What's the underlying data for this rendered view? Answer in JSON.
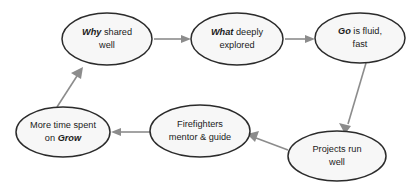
{
  "diagram": {
    "type": "cycle-flowchart",
    "colors": {
      "node_fill": "#f7f7f7",
      "node_stroke": "#2b2b2b",
      "edge": "#8c8c8c",
      "text": "#1b1b1b",
      "background": "#ffffff"
    },
    "nodes": [
      {
        "id": "why-shared-well",
        "name": "node-why-shared-well",
        "keyword": "Why",
        "line1_rest": " shared",
        "line2": "well",
        "full_text": "Why shared well",
        "cx": 107,
        "cy": 39,
        "rx": 45,
        "ry": 26
      },
      {
        "id": "what-deeply-explored",
        "name": "node-what-deeply-explored",
        "keyword": "What",
        "line1_rest": " deeply",
        "line2": "explored",
        "full_text": "What deeply explored",
        "cx": 237,
        "cy": 39,
        "rx": 46,
        "ry": 26
      },
      {
        "id": "go-is-fluid-fast",
        "name": "node-go-is-fluid-fast",
        "keyword": "Go",
        "line1_rest": " is fluid,",
        "line2": "fast",
        "full_text": "Go is fluid, fast",
        "cx": 360,
        "cy": 38,
        "rx": 45,
        "ry": 25
      },
      {
        "id": "projects-run-well",
        "name": "node-projects-run-well",
        "keyword": "",
        "line1_rest": "Projects run",
        "line2": "well",
        "full_text": "Projects run well",
        "cx": 337,
        "cy": 156,
        "rx": 49,
        "ry": 25
      },
      {
        "id": "firefighters-mentor-guide",
        "name": "node-firefighters-mentor-guide",
        "keyword": "",
        "line1_rest": "Firefighters",
        "line2": "mentor & guide",
        "full_text": "Firefighters mentor & guide",
        "cx": 200,
        "cy": 131,
        "rx": 50,
        "ry": 26
      },
      {
        "id": "more-time-spent-on-grow",
        "name": "node-more-time-spent-on-grow",
        "keyword": "",
        "line1_rest": "More time spent",
        "line2_prefix": "on ",
        "line2_keyword": "Grow",
        "full_text": "More time spent on Grow",
        "cx": 63,
        "cy": 132,
        "rx": 47,
        "ry": 25
      }
    ],
    "edges": [
      {
        "id": "edge-why-to-what",
        "name": "edge-why-to-what",
        "from": "why-shared-well",
        "to": "what-deeply-explored",
        "label": ""
      },
      {
        "id": "edge-what-to-go",
        "name": "edge-what-to-go",
        "from": "what-deeply-explored",
        "to": "go-is-fluid-fast",
        "label": ""
      },
      {
        "id": "edge-go-to-projects",
        "name": "edge-go-to-projects",
        "from": "go-is-fluid-fast",
        "to": "projects-run-well",
        "label": ""
      },
      {
        "id": "edge-projects-to-firefighters",
        "name": "edge-projects-to-firefighters",
        "from": "projects-run-well",
        "to": "firefighters-mentor-guide",
        "label": ""
      },
      {
        "id": "edge-firefighters-to-grow",
        "name": "edge-firefighters-to-grow",
        "from": "firefighters-mentor-guide",
        "to": "more-time-spent-on-grow",
        "label": ""
      },
      {
        "id": "edge-grow-to-why",
        "name": "edge-grow-to-why",
        "from": "more-time-spent-on-grow",
        "to": "why-shared-well",
        "label": ""
      }
    ]
  }
}
